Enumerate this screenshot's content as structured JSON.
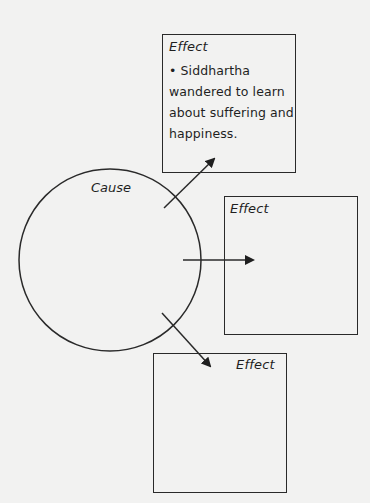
{
  "diagram": {
    "type": "cause-effect",
    "cause": {
      "label": "Cause"
    },
    "effects": [
      {
        "title": "Effect",
        "bullet": "• Siddhartha wandered to learn about suffering and happiness.",
        "lines": [
          "• Siddhartha",
          "wandered to learn",
          "about suffering and",
          "happiness."
        ]
      },
      {
        "title": "Effect",
        "text": ""
      },
      {
        "title": "Effect",
        "text": ""
      }
    ],
    "colors": {
      "stroke": "#2a2a2a",
      "background": "#f2f2f1"
    }
  }
}
